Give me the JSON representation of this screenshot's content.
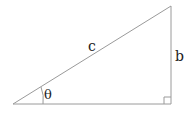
{
  "diagram": {
    "type": "right-triangle",
    "labels": {
      "hypotenuse": "c",
      "opposite": "b",
      "angle": "θ"
    },
    "colors": {
      "stroke": "#9a9a9a",
      "text": "#222222"
    }
  }
}
